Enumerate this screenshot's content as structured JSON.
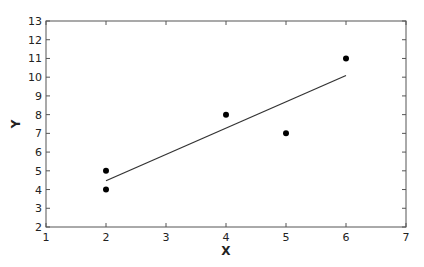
{
  "chart_data": {
    "type": "scatter",
    "title": "",
    "xlabel": "X",
    "ylabel": "Y",
    "xlim": [
      1,
      7
    ],
    "ylim": [
      2,
      13
    ],
    "xticks": [
      1,
      2,
      3,
      4,
      5,
      6,
      7
    ],
    "yticks": [
      2,
      3,
      4,
      5,
      6,
      7,
      8,
      9,
      10,
      11,
      12,
      13
    ],
    "grid": false,
    "legend": null,
    "series": [
      {
        "name": "data",
        "type": "scatter",
        "points": [
          {
            "x": 2,
            "y": 4
          },
          {
            "x": 2,
            "y": 5
          },
          {
            "x": 4,
            "y": 8
          },
          {
            "x": 5,
            "y": 7
          },
          {
            "x": 6,
            "y": 11
          }
        ],
        "color": "#000000"
      },
      {
        "name": "regression line",
        "type": "line",
        "points": [
          {
            "x": 2,
            "y": 4.47
          },
          {
            "x": 6,
            "y": 10.09
          }
        ],
        "color": "#333333"
      }
    ]
  },
  "layout": {
    "plot": {
      "left": 46,
      "right": 406,
      "top": 21,
      "bottom": 227
    }
  }
}
